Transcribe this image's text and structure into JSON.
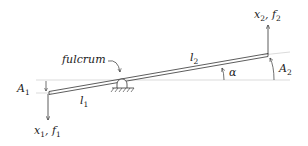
{
  "diagram": {
    "type": "lever mechanics diagram",
    "labels": {
      "fulcrum": "fulcrum",
      "l1": {
        "base": "l",
        "sub": "1"
      },
      "l2": {
        "base": "l",
        "sub": "2"
      },
      "alpha": "α",
      "A1": {
        "base": "A",
        "sub": "1"
      },
      "A2": {
        "base": "A",
        "sub": "2"
      },
      "x1f1": {
        "a": "x",
        "asub": "1",
        "sep": ", ",
        "b": "f",
        "bsub": "1"
      },
      "x2f2": {
        "a": "x",
        "asub": "2",
        "sep": ", ",
        "b": "f",
        "bsub": "2"
      }
    },
    "colors": {
      "stroke": "#333333",
      "reference": "#bbbbbb"
    }
  }
}
